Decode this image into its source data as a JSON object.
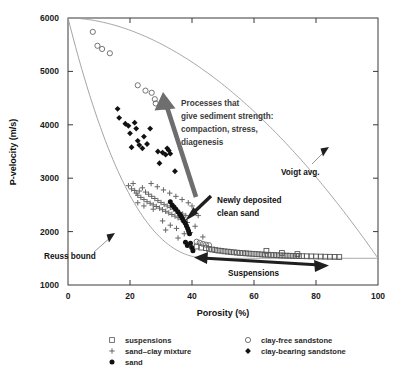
{
  "chart_data": {
    "type": "scatter",
    "title": "",
    "xlabel": "Porosity (%)",
    "ylabel": "P-velocity (m/s)",
    "xlim": [
      0,
      100
    ],
    "ylim": [
      1000,
      6000
    ],
    "xticks": [
      0,
      20,
      40,
      60,
      80,
      100
    ],
    "yticks": [
      1000,
      2000,
      3000,
      4000,
      5000,
      6000
    ],
    "grid": false,
    "legend_position": "below-axes",
    "series": [
      {
        "name": "suspensions",
        "marker": "open-square",
        "color": "#555555",
        "points": [
          [
            41.5,
            1720
          ],
          [
            43.0,
            1700
          ],
          [
            44.5,
            1690
          ],
          [
            45.5,
            1675
          ],
          [
            46.5,
            1665
          ],
          [
            47.5,
            1655
          ],
          [
            48.5,
            1645
          ],
          [
            49.5,
            1640
          ],
          [
            50.5,
            1630
          ],
          [
            51.5,
            1625
          ],
          [
            52.5,
            1618
          ],
          [
            53.5,
            1612
          ],
          [
            54.5,
            1606
          ],
          [
            55.5,
            1600
          ],
          [
            56.5,
            1596
          ],
          [
            57.5,
            1592
          ],
          [
            58.5,
            1588
          ],
          [
            59.5,
            1584
          ],
          [
            60.5,
            1580
          ],
          [
            61.5,
            1576
          ],
          [
            62.5,
            1572
          ],
          [
            63.5,
            1568
          ],
          [
            64.5,
            1566
          ],
          [
            65.5,
            1562
          ],
          [
            66.5,
            1560
          ],
          [
            67.5,
            1557
          ],
          [
            68.5,
            1554
          ],
          [
            69.5,
            1552
          ],
          [
            70.5,
            1550
          ],
          [
            71.5,
            1548
          ],
          [
            72.5,
            1546
          ],
          [
            73.5,
            1544
          ],
          [
            74.5,
            1542
          ],
          [
            75.5,
            1540
          ],
          [
            77.0,
            1538
          ],
          [
            78.5,
            1536
          ],
          [
            80.0,
            1534
          ],
          [
            81.5,
            1532
          ],
          [
            83.0,
            1530
          ],
          [
            84.5,
            1528
          ],
          [
            86.0,
            1526
          ],
          [
            64.0,
            1640
          ],
          [
            69.0,
            1600
          ],
          [
            74.0,
            1580
          ],
          [
            87.5,
            1524
          ]
        ]
      },
      {
        "name": "sand-clay mixture",
        "marker": "plus",
        "color": "#666666",
        "points": [
          [
            19.5,
            2860
          ],
          [
            20.5,
            2800
          ],
          [
            21.5,
            2770
          ],
          [
            22.0,
            2720
          ],
          [
            22.5,
            2680
          ],
          [
            23.5,
            2640
          ],
          [
            24.0,
            2820
          ],
          [
            24.5,
            2600
          ],
          [
            25.0,
            2740
          ],
          [
            25.5,
            2560
          ],
          [
            26.0,
            2700
          ],
          [
            26.5,
            2530
          ],
          [
            27.0,
            2660
          ],
          [
            27.5,
            2500
          ],
          [
            28.0,
            2620
          ],
          [
            28.5,
            2470
          ],
          [
            29.0,
            2580
          ],
          [
            29.5,
            2440
          ],
          [
            30.0,
            2545
          ],
          [
            30.5,
            2410
          ],
          [
            31.0,
            2510
          ],
          [
            31.5,
            2380
          ],
          [
            32.0,
            2480
          ],
          [
            32.5,
            2350
          ],
          [
            33.0,
            2450
          ],
          [
            33.5,
            2320
          ],
          [
            34.0,
            2420
          ],
          [
            34.5,
            2290
          ],
          [
            35.0,
            2390
          ],
          [
            35.5,
            2260
          ],
          [
            36.0,
            2360
          ],
          [
            36.5,
            2230
          ],
          [
            37.0,
            2330
          ],
          [
            37.5,
            2200
          ],
          [
            38.0,
            2300
          ],
          [
            38.5,
            2170
          ],
          [
            21.0,
            2900
          ],
          [
            23.0,
            2760
          ],
          [
            26.8,
            2900
          ],
          [
            28.8,
            2840
          ],
          [
            30.8,
            2780
          ],
          [
            32.8,
            2720
          ],
          [
            34.8,
            2660
          ],
          [
            36.8,
            2600
          ],
          [
            38.8,
            2540
          ],
          [
            40.0,
            2480
          ],
          [
            41.0,
            2100
          ],
          [
            39.5,
            1980
          ],
          [
            37.5,
            1960
          ],
          [
            35.0,
            2060
          ],
          [
            33.0,
            2120
          ],
          [
            30.5,
            2200
          ],
          [
            40.5,
            2360
          ],
          [
            42.0,
            2300
          ],
          [
            43.5,
            1900
          ],
          [
            35.5,
            1880
          ],
          [
            31.5,
            2030
          ],
          [
            27.5,
            2420
          ],
          [
            24.5,
            2480
          ],
          [
            22.5,
            2540
          ]
        ]
      },
      {
        "name": "sand",
        "marker": "filled-circle",
        "color": "#111111",
        "points": [
          [
            33.0,
            2560
          ],
          [
            33.6,
            2500
          ],
          [
            34.2,
            2460
          ],
          [
            34.8,
            2420
          ],
          [
            35.4,
            2370
          ],
          [
            36.0,
            2330
          ],
          [
            36.4,
            2290
          ],
          [
            36.9,
            2250
          ],
          [
            37.3,
            2200
          ],
          [
            37.8,
            2160
          ],
          [
            38.2,
            2110
          ],
          [
            38.6,
            2060
          ],
          [
            38.9,
            2010
          ],
          [
            39.2,
            1960
          ],
          [
            39.5,
            1780
          ],
          [
            39.9,
            1700
          ],
          [
            40.3,
            1640
          ],
          [
            38.5,
            1740
          ],
          [
            37.9,
            1800
          ]
        ]
      },
      {
        "name": "clay-free sandstone",
        "marker": "open-circle",
        "color": "#666666",
        "points": [
          [
            8.0,
            5740
          ],
          [
            9.5,
            5480
          ],
          [
            11.0,
            5420
          ],
          [
            13.5,
            5340
          ],
          [
            22.5,
            4740
          ],
          [
            25.0,
            4640
          ],
          [
            27.0,
            4600
          ],
          [
            28.0,
            4480
          ],
          [
            28.3,
            4400
          ],
          [
            31.0,
            4340
          ],
          [
            41.5,
            1810
          ],
          [
            42.5,
            1790
          ],
          [
            43.5,
            1770
          ],
          [
            44.5,
            1755
          ],
          [
            45.5,
            1745
          ]
        ]
      },
      {
        "name": "clay-bearing sandstone",
        "marker": "filled-diamond",
        "color": "#111111",
        "points": [
          [
            16.0,
            4300
          ],
          [
            16.5,
            4130
          ],
          [
            18.5,
            4020
          ],
          [
            19.5,
            3980
          ],
          [
            20.0,
            3840
          ],
          [
            21.5,
            4040
          ],
          [
            22.0,
            3930
          ],
          [
            22.5,
            3700
          ],
          [
            23.0,
            3620
          ],
          [
            24.0,
            3560
          ],
          [
            24.5,
            3780
          ],
          [
            25.5,
            3640
          ],
          [
            26.5,
            3930
          ],
          [
            29.0,
            3500
          ],
          [
            30.5,
            3480
          ],
          [
            31.5,
            3440
          ],
          [
            32.0,
            3560
          ],
          [
            32.5,
            3520
          ],
          [
            33.0,
            3460
          ],
          [
            29.5,
            3280
          ],
          [
            34.5,
            3130
          ],
          [
            20.5,
            3580
          ]
        ]
      }
    ],
    "curves": [
      {
        "name": "Voigt avg.",
        "note": "upper bound, concave descending from 6000 at 0% to ~1500 at 100%"
      },
      {
        "name": "Reuss bound",
        "note": "lower bound, steeply descending from 6000 at 0% to ~1500 at ~45% then flat"
      }
    ],
    "annotations": [
      {
        "name": "processes-arrow-label",
        "lines": [
          "Processes that",
          "give sediment strength:",
          "compaction, stress,",
          "diagenesis"
        ]
      },
      {
        "name": "voigt-label",
        "text": "Voigt avg."
      },
      {
        "name": "reuss-label",
        "text": "Reuss bound"
      },
      {
        "name": "newly-deposited-label",
        "lines": [
          "Newly deposited",
          "clean sand"
        ]
      },
      {
        "name": "suspensions-label",
        "text": "Suspensions"
      }
    ]
  },
  "axes": {
    "x_title": "Porosity (%)",
    "y_title": "P-velocity (m/s)",
    "x_tick_labels": [
      "0",
      "20",
      "40",
      "60",
      "80",
      "100"
    ],
    "y_tick_labels": [
      "1000",
      "2000",
      "3000",
      "4000",
      "5000",
      "6000"
    ]
  },
  "annotations": {
    "processes_line1": "Processes that",
    "processes_line2": "give sediment strength:",
    "processes_line3": "compaction, stress,",
    "processes_line4": "diagenesis",
    "voigt": "Voigt avg.",
    "reuss": "Reuss bound",
    "newly_line1": "Newly deposited",
    "newly_line2": "clean sand",
    "suspensions": "Suspensions"
  },
  "legend": {
    "items": [
      {
        "label": "suspensions",
        "marker": "open-square"
      },
      {
        "label": "sand–clay mixture",
        "marker": "plus"
      },
      {
        "label": "sand",
        "marker": "filled-circle"
      },
      {
        "label": "clay-free sandstone",
        "marker": "open-circle"
      },
      {
        "label": "clay-bearing sandstone",
        "marker": "filled-diamond"
      }
    ]
  },
  "colors": {
    "frame": "#3a3a3a",
    "curve": "#9a9a9a",
    "arrow_gray": "#6e6e6e",
    "arrow_dark": "#1f1f1f",
    "marker_open": "#666666",
    "marker_fill": "#111111"
  }
}
